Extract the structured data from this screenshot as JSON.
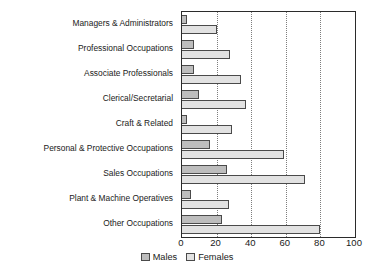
{
  "chart_data": {
    "type": "bar",
    "orientation": "horizontal",
    "title": "",
    "subtitle": "",
    "xlabel": "",
    "ylabel": "",
    "xlim": [
      0,
      100
    ],
    "xticks": [
      0,
      20,
      40,
      60,
      80,
      100
    ],
    "gridlines": [
      20,
      40,
      60,
      80
    ],
    "grid": true,
    "grid_style": "dotted",
    "legend_position": "bottom-center",
    "categories": [
      "Managers & Administrators",
      "Professional Occupations",
      "Associate Professionals",
      "Clerical/Secretarial",
      "Craft & Related",
      "Personal & Protective Occupations",
      "Sales Occupations",
      "Plant & Machine Operatives",
      "Other Occupations"
    ],
    "series": [
      {
        "name": "Males",
        "color": "#bdbdbd",
        "values": [
          3,
          7,
          7,
          10,
          3,
          16,
          26,
          5,
          23
        ]
      },
      {
        "name": "Females",
        "color": "#e2e2e2",
        "values": [
          20,
          28,
          34,
          37,
          29,
          59,
          71,
          27,
          80
        ]
      }
    ]
  },
  "colors": {
    "males": "#bdbdbd",
    "females": "#e2e2e2",
    "bar_outline": "#4a4a4a",
    "axis": "#2b2b2b",
    "gridline": "#7d7d7d",
    "background": "#ffffff",
    "text": "#1a1a1a"
  }
}
